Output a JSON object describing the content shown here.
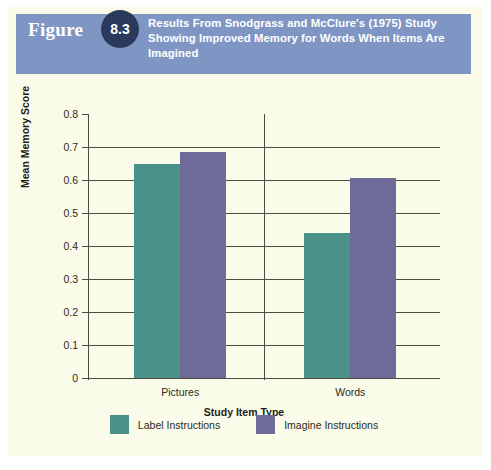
{
  "figure": {
    "label": "Figure",
    "number": "8.3",
    "title": "Results From Snodgrass and McClure's (1975) Study Showing Improved Memory for Words When Items Are Imagined",
    "banner_color": "#7f96c4",
    "badge_color": "#2b3a5c",
    "page_background": "#fbfbe9"
  },
  "chart_data": {
    "type": "bar",
    "title": "",
    "categories": [
      "Pictures",
      "Words"
    ],
    "series": [
      {
        "name": "Label Instructions",
        "values": [
          0.65,
          0.44
        ],
        "color": "#4a9189"
      },
      {
        "name": "Imagine Instructions",
        "values": [
          0.685,
          0.605
        ],
        "color": "#6f6b99"
      }
    ],
    "xlabel": "Study Item Type",
    "ylabel": "Mean Memory Score",
    "ylim": [
      0,
      0.8
    ],
    "ytick_labels": [
      "0.8",
      "0.7",
      "0.6",
      "0.5",
      "0.4",
      "0.3",
      "0.2",
      "0.1",
      "0"
    ],
    "ytick_values": [
      0.8,
      0.7,
      0.6,
      0.5,
      0.4,
      0.3,
      0.2,
      0.1,
      0
    ],
    "grid": "horizontal",
    "legend_position": "bottom-center"
  }
}
